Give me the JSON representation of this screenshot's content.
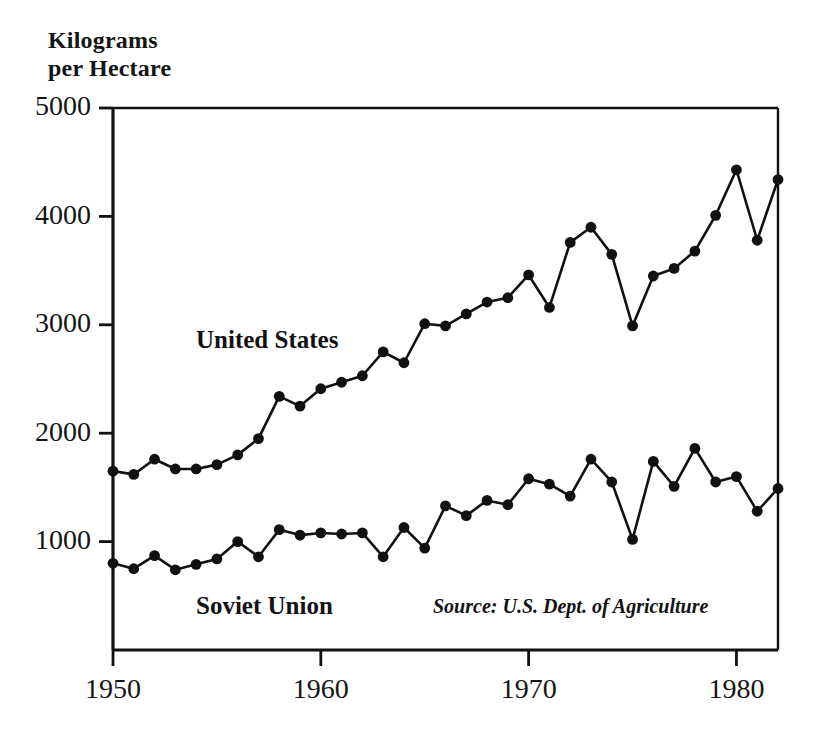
{
  "chart_data": {
    "type": "line",
    "title": "Kilograms\nper Hectare",
    "title_line1": "Kilograms",
    "title_line2": "per Hectare",
    "xlabel": "",
    "ylabel": "Kilograms per Hectare",
    "xlim": [
      1950,
      1982
    ],
    "ylim": [
      0,
      5000
    ],
    "grid": false,
    "legend_position": "inline-annotations",
    "yticks": [
      1000,
      2000,
      3000,
      4000,
      5000
    ],
    "ytick_labels": [
      "1000",
      "2000",
      "3000",
      "4000",
      "5000"
    ],
    "xticks": [
      1950,
      1960,
      1970,
      1980
    ],
    "xtick_labels": [
      "1950",
      "1960",
      "1970",
      "1980"
    ],
    "x": [
      1950,
      1951,
      1952,
      1953,
      1954,
      1955,
      1956,
      1957,
      1958,
      1959,
      1960,
      1961,
      1962,
      1963,
      1964,
      1965,
      1966,
      1967,
      1968,
      1969,
      1970,
      1971,
      1972,
      1973,
      1974,
      1975,
      1976,
      1977,
      1978,
      1979,
      1980,
      1981,
      1982
    ],
    "series": [
      {
        "name": "United States",
        "label": "United States",
        "marker": "filled-circle",
        "color": "#111111",
        "values": [
          1650,
          1620,
          1760,
          1670,
          1670,
          1710,
          1800,
          1950,
          2340,
          2250,
          2410,
          2470,
          2530,
          2750,
          2650,
          3010,
          2990,
          3100,
          3210,
          3250,
          3460,
          3160,
          3760,
          3900,
          3650,
          2990,
          3450,
          3520,
          3680,
          4010,
          4430,
          3780,
          4340
        ],
        "annotation_text": "United States"
      },
      {
        "name": "Soviet Union",
        "label": "Soviet Union",
        "marker": "filled-circle",
        "color": "#111111",
        "values": [
          800,
          750,
          870,
          740,
          790,
          840,
          1000,
          860,
          1110,
          1060,
          1080,
          1070,
          1080,
          860,
          1130,
          940,
          1330,
          1240,
          1380,
          1340,
          1580,
          1530,
          1420,
          1760,
          1550,
          1020,
          1740,
          1510,
          1860,
          1550,
          1600,
          1280,
          1490
        ],
        "annotation_text": "Soviet Union"
      }
    ],
    "annotations": [
      {
        "name": "source-note",
        "text": "Source: U.S. Dept. of Agriculture"
      }
    ]
  },
  "labels": {
    "series_us": "United States",
    "series_su": "Soviet Union",
    "source": "Source: U.S. Dept. of Agriculture"
  }
}
